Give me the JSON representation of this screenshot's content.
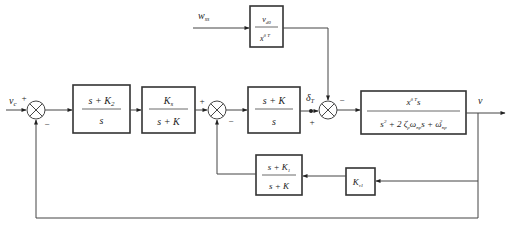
{
  "diagram": {
    "type": "control-system-block-diagram",
    "signals": {
      "input": "v",
      "input_sub": "c",
      "disturbance": "w",
      "disturbance_sub": "ss",
      "pickoff": "δ",
      "pickoff_sub": "T",
      "output": "v"
    },
    "summing_junctions": [
      {
        "id": "sum1",
        "signs": {
          "left": "+",
          "bottom": "−"
        }
      },
      {
        "id": "sum2",
        "signs": {
          "left": "+",
          "bottom": "−"
        }
      },
      {
        "id": "sum3",
        "signs": {
          "left": "+",
          "top": "−"
        }
      }
    ],
    "blocks": {
      "b1": {
        "num": "s + K",
        "num_sub": "2",
        "den": "s"
      },
      "b2": {
        "num": "K",
        "num_sub": "s",
        "den": "s + K"
      },
      "b3": {
        "num": "s + K",
        "den": "s"
      },
      "disturbance": {
        "num": "v",
        "num_sub": "d0",
        "den": "x",
        "den_sup": "δ T"
      },
      "plant": {
        "num": "x",
        "num_sup": "δ T",
        "num_tail": "s",
        "den_parts": [
          "s",
          "2",
          " + 2 ζ",
          "p",
          "ω",
          "np",
          "s + ω",
          "np",
          "2"
        ]
      },
      "fb_filter": {
        "num": "s + K",
        "num_sub": "1",
        "den": "s + K"
      },
      "fb_gain": {
        "label": "K",
        "label_sub": "v1"
      }
    },
    "signs": {
      "plus": "+",
      "minus": "−"
    }
  }
}
